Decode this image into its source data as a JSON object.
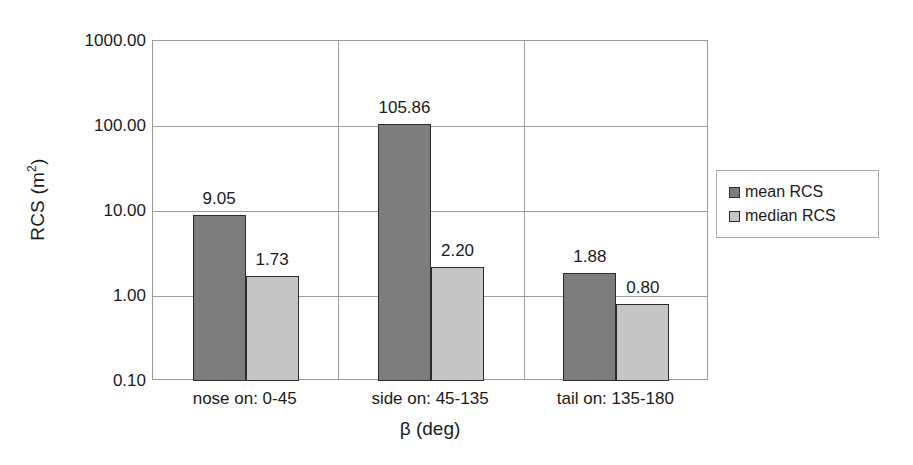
{
  "chart_data": {
    "type": "bar",
    "title": "",
    "subtitle": "",
    "xlabel": "β (deg)",
    "ylabel": "RCS (m²)",
    "ylabel_base": "RCS (m",
    "ylabel_sup": "2",
    "ylabel_close": ")",
    "yscale": "log",
    "ylim": [
      0.1,
      1000
    ],
    "ytick_labels": [
      "1000.00",
      "100.00",
      "10.00",
      "1.00",
      "0.10"
    ],
    "ytick_values": [
      1000,
      100,
      10,
      1,
      0.1
    ],
    "grid": true,
    "legend_position": "right",
    "categories": [
      "nose on: 0-45",
      "side on: 45-135",
      "tail on: 135-180"
    ],
    "series": [
      {
        "name": "mean RCS",
        "color": "#7d7d7d",
        "values": [
          9.05,
          105.86,
          1.88
        ],
        "labels": [
          "9.05",
          "105.86",
          "1.88"
        ]
      },
      {
        "name": "median RCS",
        "color": "#c6c6c6",
        "values": [
          1.73,
          2.2,
          0.8
        ],
        "labels": [
          "1.73",
          "2.20",
          "0.80"
        ]
      }
    ]
  },
  "legend": {
    "items": [
      {
        "label": "mean RCS",
        "color": "#7d7d7d"
      },
      {
        "label": "median RCS",
        "color": "#c6c6c6"
      }
    ]
  },
  "axes": {
    "y_title": "RCS (m2)",
    "x_title": "β (deg)"
  },
  "colors": {
    "mean_fill": "#7d7d7d",
    "median_fill": "#c6c6c6",
    "bar_outline": "#2b2b2b",
    "gridline": "#9d9d9d",
    "text": "#1a1a1a",
    "background": "#ffffff"
  }
}
